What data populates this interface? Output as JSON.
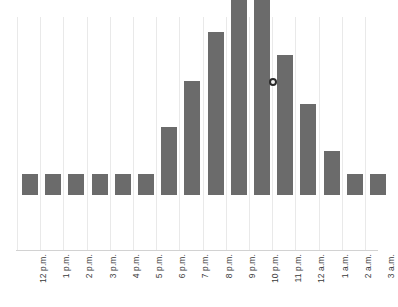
{
  "chart_data": {
    "type": "bar",
    "title": "",
    "xlabel": "",
    "ylabel": "",
    "grid": "vertical",
    "legend": "none",
    "ylim": [
      0,
      100
    ],
    "categories": [
      "12 p.m.",
      "1 p.m.",
      "2 p.m.",
      "3 p.m.",
      "4 p.m.",
      "5 p.m.",
      "6 p.m.",
      "7 p.m.",
      "8 p.m.",
      "9 p.m.",
      "10 p.m.",
      "11 p.m.",
      "12 a.m.",
      "1 a.m.",
      "2 a.m.",
      "3 a.m."
    ],
    "values": [
      9,
      9,
      9,
      9,
      9,
      9,
      29,
      49,
      70,
      90,
      100,
      60,
      39,
      19,
      9,
      9
    ],
    "bar_color": "#6b6b6b",
    "gridline_color": "#e9e9e9",
    "axis_color": "#d2d2d2",
    "label_color": "#3a3a3a"
  },
  "marker": {
    "name": "hover-point",
    "category": "10 p.m.",
    "color": "#2b2b2b"
  }
}
